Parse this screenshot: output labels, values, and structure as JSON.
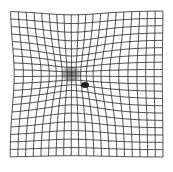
{
  "figure": {
    "background": "#ffffff",
    "line_color": "#3a3a3a",
    "grid": {
      "x0": 10,
      "y0": 11,
      "x1": 163,
      "y1": 157,
      "cells_x": 20,
      "cells_y": 20
    },
    "distortion": {
      "cx": 72,
      "cy": 75,
      "strength": 0.45,
      "radius": 45
    },
    "scotoma": {
      "cx": 71,
      "cy": 74,
      "rx": 11,
      "ry": 9,
      "color": "#2a2a2a",
      "opacity": 0.75
    },
    "spot": {
      "cx": 85,
      "cy": 85,
      "rx": 4,
      "ry": 3,
      "color": "#1e1e1e"
    }
  }
}
